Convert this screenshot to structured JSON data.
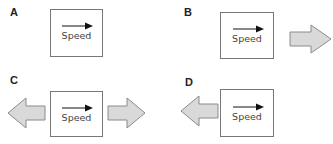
{
  "colors": {
    "box_border": "#777777",
    "arrow_fill": "#d9d9d9",
    "arrow_stroke": "#8a8a8a",
    "speed_arrow": "#111111"
  },
  "panels": [
    {
      "label": "A",
      "speed_label": "Speed",
      "force_arrows": []
    },
    {
      "label": "B",
      "speed_label": "Speed",
      "force_arrows": [
        "right"
      ]
    },
    {
      "label": "C",
      "speed_label": "Speed",
      "force_arrows": [
        "left",
        "right"
      ]
    },
    {
      "label": "D",
      "speed_label": "Speed",
      "force_arrows": [
        "left"
      ]
    }
  ]
}
